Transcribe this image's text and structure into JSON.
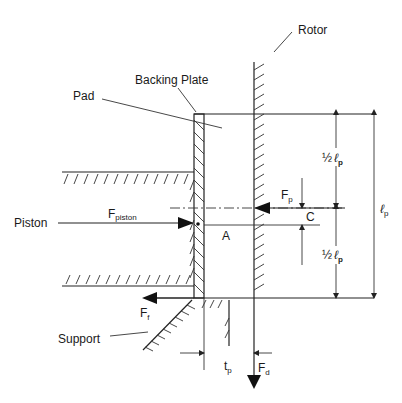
{
  "diagram": {
    "labels": {
      "rotor": "Rotor",
      "backing_plate": "Backing Plate",
      "pad": "Pad",
      "piston": "Piston",
      "support": "Support",
      "point_a": "A",
      "point_c": "C"
    },
    "forces": {
      "piston": {
        "main": "F",
        "sub": "piston"
      },
      "pad_reaction": {
        "main": "F",
        "sub": "p"
      },
      "friction": {
        "main": "F",
        "sub": "f"
      },
      "drag": {
        "main": "F",
        "sub": "d"
      }
    },
    "dimensions": {
      "half_length_top": {
        "prefix": "½",
        "main": "ℓ",
        "sub": "p"
      },
      "half_length_bottom": {
        "prefix": "½",
        "main": "ℓ",
        "sub": "p"
      },
      "pad_length": {
        "main": "ℓ",
        "sub": "p"
      },
      "pad_thickness": {
        "main": "t",
        "sub": "p"
      }
    },
    "colors": {
      "line": "#222222",
      "background": "#ffffff"
    }
  }
}
